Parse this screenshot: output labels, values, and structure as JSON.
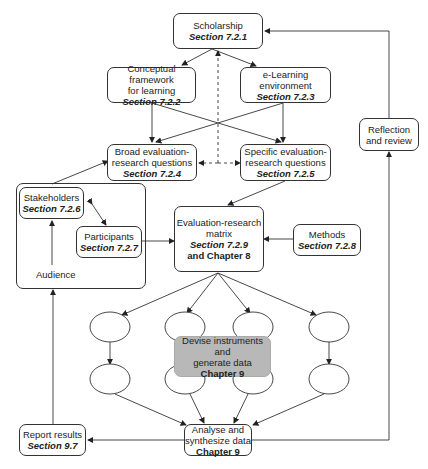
{
  "nodes": {
    "scholarship": {
      "title": "Scholarship",
      "section": "Section 7.2.1"
    },
    "conceptual": {
      "title1": "Conceptual framework",
      "title2": "for learning",
      "section": "Section 7.2.2"
    },
    "elearning": {
      "title1": "e-Learning",
      "title2": "environment",
      "section": "Section 7.2.3"
    },
    "broad": {
      "title1": "Broad evaluation-",
      "title2": "research questions",
      "section": "Section 7.2.4"
    },
    "specific": {
      "title1": "Specific evaluation-",
      "title2": "research questions",
      "section": "Section 7.2.5"
    },
    "stakeholders": {
      "title": "Stakeholders",
      "section": "Section 7.2.6"
    },
    "participants": {
      "title": "Participants",
      "section": "Section 7.2.7"
    },
    "audience": {
      "label": "Audience"
    },
    "matrix": {
      "title1": "Evaluation-research",
      "title2": "matrix",
      "section": "Section 7.2.9",
      "chapter": "and Chapter 8"
    },
    "methods": {
      "title": "Methods",
      "section": "Section 7.2.8"
    },
    "devise": {
      "title1": "Devise instruments and",
      "title2": "generate data",
      "chapter": "Chapter 9"
    },
    "analyse": {
      "title1": "Analyse and",
      "title2": "synthesize data",
      "chapter": "Chapter 9"
    },
    "report": {
      "title": "Report results",
      "section": "Section 9.7"
    },
    "reflection": {
      "title1": "Reflection",
      "title2": "and review"
    }
  },
  "colors": {
    "line": "#333333",
    "highlight_box": "#b8b8b8"
  }
}
